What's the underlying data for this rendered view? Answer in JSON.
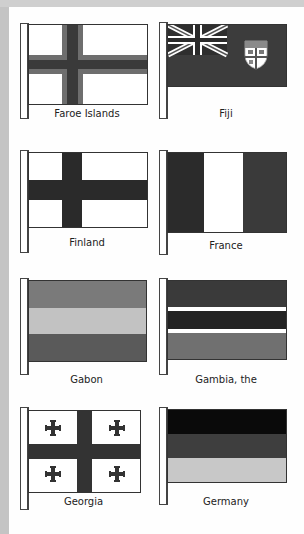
{
  "flags": [
    {
      "name": "Faroe Islands",
      "design": "nordic-cross-bordered",
      "colors": {
        "field": "#ffffff",
        "cross": "#3a3a3a",
        "cross_border": "#6e6e6e"
      }
    },
    {
      "name": "Fiji",
      "design": "blue-ensign-with-shield",
      "colors": {
        "field": "#3c3c3c",
        "canton": "#2e2e2e"
      }
    },
    {
      "name": "Finland",
      "design": "nordic-cross",
      "colors": {
        "field": "#ffffff",
        "cross": "#2a2a2a"
      }
    },
    {
      "name": "France",
      "design": "vertical-tricolor",
      "colors": {
        "left": "#2b2b2b",
        "middle": "#ffffff",
        "right": "#3a3a3a"
      }
    },
    {
      "name": "Gabon",
      "design": "horizontal-tricolor",
      "colors": {
        "top": "#7a7a7a",
        "middle": "#c2c2c2",
        "bottom": "#5a5a5a"
      }
    },
    {
      "name": "Gambia, the",
      "design": "horizontal-stripes-with-fimbriation",
      "colors": {
        "top": "#3a3a3a",
        "middle": "#222222",
        "bottom": "#707070",
        "fimbriation": "#ffffff"
      }
    },
    {
      "name": "Georgia",
      "design": "five-cross",
      "colors": {
        "field": "#ffffff",
        "cross": "#333333"
      }
    },
    {
      "name": "Germany",
      "design": "horizontal-tricolor",
      "colors": {
        "top": "#0a0a0a",
        "middle": "#3e3e3e",
        "bottom": "#c8c8c8"
      }
    }
  ]
}
